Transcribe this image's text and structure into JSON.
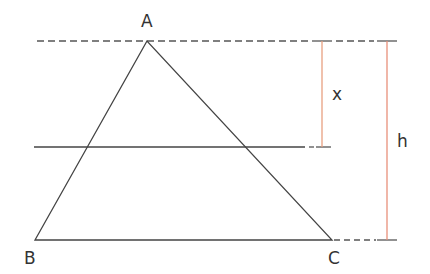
{
  "diagram": {
    "type": "geometry",
    "colors": {
      "line": "#444444",
      "dashed": "#555555",
      "measure": "#e8a080",
      "text": "#333333"
    },
    "vertices": {
      "A": {
        "label": "A",
        "x": 147,
        "y": 41
      },
      "B": {
        "label": "B",
        "x": 35,
        "y": 240
      },
      "C": {
        "label": "C",
        "x": 332,
        "y": 240
      }
    },
    "measures": {
      "x": {
        "label": "x"
      },
      "h": {
        "label": "h"
      }
    }
  }
}
